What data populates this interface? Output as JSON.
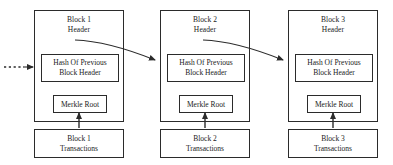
{
  "diagram": {
    "background_color": "#ffffff",
    "line_color": "#2b2b2b",
    "text_color": "#1a1a1a",
    "blocks": [
      {
        "id": "block-1",
        "header_title_line1": "Block 1",
        "header_title_line2": "Header",
        "hash_line1": "Hash Of Previous",
        "hash_line2": "Block Header",
        "merkle_label": "Merkle Root",
        "tx_line1": "Block 1",
        "tx_line2": "Transactions"
      },
      {
        "id": "block-2",
        "header_title_line1": "Block 2",
        "header_title_line2": "Header",
        "hash_line1": "Hash Of Previous",
        "hash_line2": "Block Header",
        "merkle_label": "Merkle Root",
        "tx_line1": "Block 2",
        "tx_line2": "Transactions"
      },
      {
        "id": "block-3",
        "header_title_line1": "Block 3",
        "header_title_line2": "Header",
        "hash_line1": "Hash Of Previous",
        "hash_line2": "Block Header",
        "merkle_label": "Merkle Root",
        "tx_line1": "Block 3",
        "tx_line2": "Transactions"
      }
    ],
    "connectors": {
      "incoming_dotted_label": "previous-chain-continues",
      "hash_chain_arrow_label": "header-hash-link",
      "merkle_arrow_label": "transactions-to-merkle-root"
    }
  }
}
